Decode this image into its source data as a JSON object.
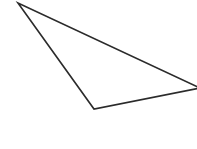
{
  "diagram": {
    "shape": "triangle",
    "stroke_color": "#2b2b2b",
    "fill_color": "#ffffff",
    "background": "#ffffff",
    "stroke_width": 1.6,
    "points": "18,3 94,109 200,88"
  }
}
